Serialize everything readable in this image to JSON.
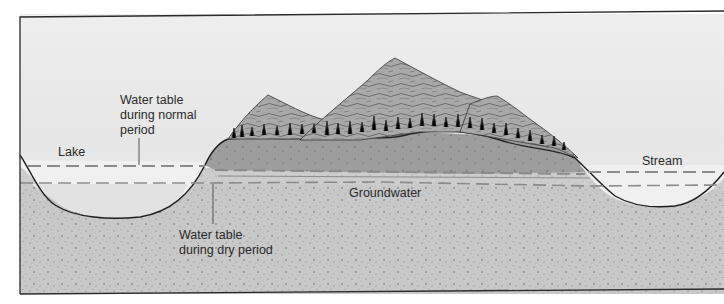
{
  "figure": {
    "labels": {
      "water_table_normal_line1": "Water table",
      "water_table_normal_line2": "during normal",
      "water_table_normal_line3": "period",
      "lake": "Lake",
      "stream": "Stream",
      "groundwater": "Groundwater",
      "water_table_dry_line1": "Water table",
      "water_table_dry_line2": "during dry period"
    },
    "colors": {
      "sky": "#ececec",
      "water": "#f2f2f2",
      "mountain_base": "#9c9c9c",
      "ground": "#c9c9c9",
      "dashed_line": "#8a8a8a",
      "outline": "#1e1e1e",
      "mountain_rock": "#8d8d8d"
    }
  }
}
